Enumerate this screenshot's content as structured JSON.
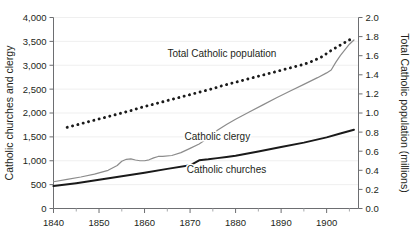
{
  "chart_data": {
    "type": "line",
    "title": "",
    "xlabel": "",
    "xlim": [
      1840,
      1907
    ],
    "xticks": [
      1840,
      1850,
      1860,
      1870,
      1880,
      1890,
      1900
    ],
    "xtick_labels": [
      "1840",
      "1850",
      "1860",
      "1870",
      "1880",
      "1890",
      "1900"
    ],
    "xminor_ticks": [
      1845,
      1855,
      1865,
      1875,
      1885,
      1895,
      1905
    ],
    "grid": false,
    "legend_position": "inline-annotations",
    "left_axis": {
      "label": "Catholic churches and clergy",
      "ylim": [
        0,
        4000
      ],
      "yticks": [
        0,
        500,
        1000,
        1500,
        2000,
        2500,
        3000,
        3500,
        4000
      ],
      "ytick_labels": [
        "0",
        "500",
        "1,000",
        "1,500",
        "2,000",
        "2,500",
        "3,000",
        "3,500",
        "4,000"
      ]
    },
    "right_axis": {
      "label": "Total Catholic population (millions)",
      "ylim": [
        0,
        2.0
      ],
      "yticks": [
        0.0,
        0.2,
        0.4,
        0.6,
        0.8,
        1.0,
        1.2,
        1.4,
        1.6,
        1.8,
        2.0
      ],
      "ytick_labels": [
        "0.0",
        "0.2",
        "0.4",
        "0.6",
        "0.8",
        "1.0",
        "1.2",
        "1.4",
        "1.6",
        "1.8",
        "2.0"
      ]
    },
    "series": [
      {
        "name": "Total Catholic population",
        "label": "Total Catholic population",
        "axis": "right",
        "style": "dotted",
        "color": "#1a1a1a",
        "unit": "millions",
        "x": [
          1843,
          1845,
          1847,
          1849,
          1851,
          1853,
          1855,
          1857,
          1859,
          1861,
          1863,
          1865,
          1867,
          1869,
          1871,
          1873,
          1875,
          1877,
          1879,
          1881,
          1883,
          1885,
          1887,
          1889,
          1891,
          1893,
          1895,
          1897,
          1899,
          1901,
          1903,
          1905,
          1906
        ],
        "y": [
          0.85,
          0.875,
          0.9,
          0.925,
          0.95,
          0.975,
          1.0,
          1.025,
          1.055,
          1.08,
          1.105,
          1.13,
          1.155,
          1.18,
          1.205,
          1.23,
          1.255,
          1.285,
          1.31,
          1.335,
          1.36,
          1.385,
          1.41,
          1.435,
          1.46,
          1.485,
          1.51,
          1.545,
          1.59,
          1.655,
          1.71,
          1.765,
          1.79
        ]
      },
      {
        "name": "Catholic clergy",
        "label": "Catholic clergy",
        "axis": "left",
        "style": "solid-thin",
        "color": "#8c8c8c",
        "unit": "clergy",
        "x": [
          1840,
          1843,
          1846,
          1849,
          1852,
          1854,
          1855,
          1856,
          1857,
          1858,
          1859,
          1860,
          1861,
          1862,
          1863,
          1864,
          1866,
          1868,
          1870,
          1872,
          1874,
          1876,
          1878,
          1880,
          1883,
          1886,
          1889,
          1892,
          1895,
          1898,
          1900,
          1901,
          1902,
          1903,
          1904,
          1905,
          1906
        ],
        "y": [
          560,
          610,
          660,
          720,
          800,
          900,
          990,
          1030,
          1040,
          1015,
          1000,
          1000,
          1020,
          1060,
          1090,
          1090,
          1110,
          1170,
          1260,
          1350,
          1480,
          1640,
          1760,
          1870,
          2020,
          2170,
          2320,
          2460,
          2600,
          2740,
          2840,
          2900,
          3060,
          3200,
          3320,
          3440,
          3530
        ]
      },
      {
        "name": "Catholic churches",
        "label": "Catholic churches",
        "axis": "left",
        "style": "solid-thick",
        "color": "#1a1a1a",
        "unit": "churches",
        "x": [
          1840,
          1845,
          1850,
          1855,
          1860,
          1865,
          1870,
          1872,
          1874,
          1876,
          1878,
          1880,
          1885,
          1890,
          1895,
          1900,
          1903,
          1906
        ],
        "y": [
          470,
          530,
          600,
          675,
          750,
          830,
          905,
          1010,
          1030,
          1055,
          1080,
          1105,
          1195,
          1290,
          1380,
          1490,
          1570,
          1650
        ]
      }
    ],
    "annotations": [
      {
        "name": "total-catholic-population-label",
        "text": "Total Catholic population",
        "x": 1877,
        "y_left": 3170,
        "anchor": "middle"
      },
      {
        "name": "catholic-clergy-label",
        "text": "Catholic clergy",
        "x": 1876,
        "y_left": 1430,
        "anchor": "middle"
      },
      {
        "name": "catholic-churches-label",
        "text": "Catholic churches",
        "x": 1878,
        "y_left": 740,
        "anchor": "middle"
      }
    ]
  }
}
